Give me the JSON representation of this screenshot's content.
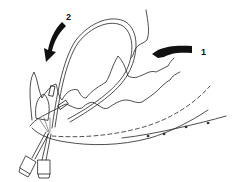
{
  "figure": {
    "arrows": [
      {
        "label": "1",
        "direction": "left"
      },
      {
        "label": "2",
        "direction": "down-left"
      }
    ],
    "colors": {
      "ink": "#111111",
      "background": "#ffffff"
    }
  }
}
